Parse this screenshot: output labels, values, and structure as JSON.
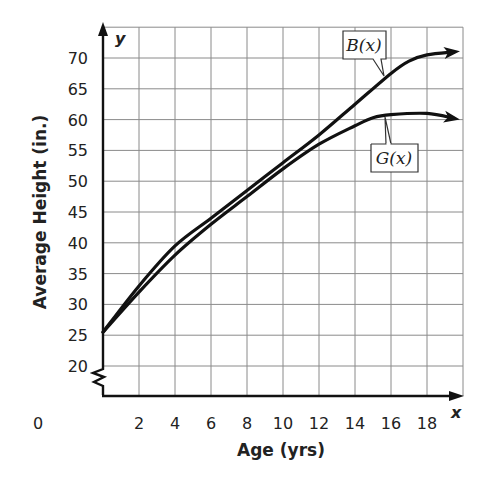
{
  "chart_data": {
    "type": "line",
    "title": "",
    "xlabel": "Age (yrs)",
    "ylabel": "Average Height (in.)",
    "x_axis_var": "x",
    "y_axis_var": "y",
    "xlim": [
      0,
      19.5
    ],
    "ylim": [
      15,
      75
    ],
    "y_axis_break": true,
    "grid": true,
    "x_ticks": [
      0,
      2,
      4,
      6,
      8,
      10,
      12,
      14,
      16,
      18
    ],
    "y_ticks": [
      20,
      25,
      30,
      35,
      40,
      45,
      50,
      55,
      60,
      65,
      70
    ],
    "x_grid_step": 2,
    "y_grid_step": 5,
    "series": [
      {
        "name": "B(x)",
        "label": "B(x)",
        "x": [
          0,
          2,
          4,
          6,
          8,
          10,
          12,
          14,
          16,
          17,
          18,
          19.5
        ],
        "values": [
          25.5,
          33,
          39.5,
          44,
          48.5,
          53,
          57.5,
          62.5,
          67.5,
          69.5,
          70.5,
          71
        ]
      },
      {
        "name": "G(x)",
        "label": "G(x)",
        "x": [
          0,
          2,
          4,
          6,
          8,
          10,
          12,
          14,
          15,
          16,
          18,
          19.5
        ],
        "values": [
          25.5,
          32,
          38,
          43,
          47.5,
          52,
          56,
          59,
          60.3,
          60.8,
          61,
          60.2
        ]
      }
    ]
  },
  "labels": {
    "y_axis_title": "Average Height (in.)",
    "x_axis_title": "Age (yrs)",
    "x_var": "x",
    "y_var": "y",
    "origin": "0",
    "b_label": "B(x)",
    "g_label": "G(x)"
  }
}
